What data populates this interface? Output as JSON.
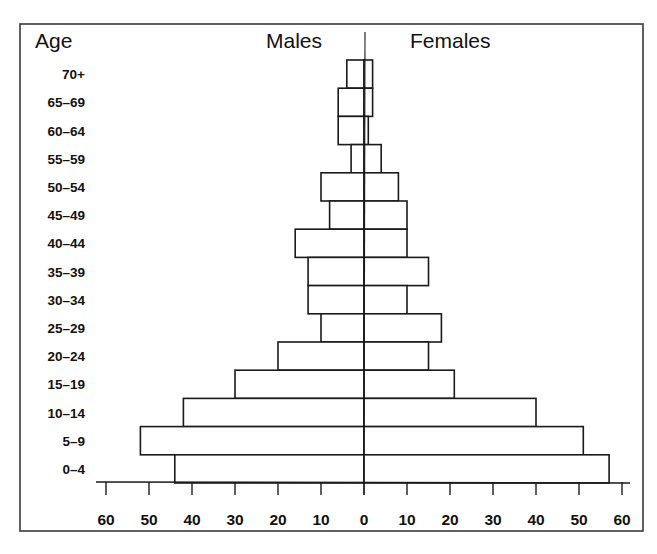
{
  "chart_data": {
    "type": "bar",
    "orientation": "horizontal",
    "subtype": "population-pyramid",
    "title": "",
    "y_header": "Age",
    "left_header": "Males",
    "right_header": "Females",
    "categories": [
      "70+",
      "65–69",
      "60–64",
      "55–59",
      "50–54",
      "45–49",
      "40–44",
      "35–39",
      "30–34",
      "25–29",
      "20–24",
      "15–19",
      "10–14",
      "5–9",
      "0–4"
    ],
    "series": [
      {
        "name": "Males",
        "side": "left",
        "values": [
          4,
          6,
          6,
          3,
          10,
          8,
          16,
          13,
          13,
          10,
          20,
          30,
          42,
          52,
          44
        ]
      },
      {
        "name": "Females",
        "side": "right",
        "values": [
          2,
          2,
          1,
          4,
          8,
          10,
          10,
          15,
          10,
          18,
          15,
          21,
          40,
          51,
          57
        ]
      }
    ],
    "x_ticks": [
      60,
      50,
      40,
      30,
      20,
      10,
      0,
      10,
      20,
      30,
      40,
      50,
      60
    ],
    "xlim": [
      -60,
      60
    ],
    "xlabel": "",
    "grid": false,
    "legend": "none",
    "colors": {
      "bar_fill": "#ffffff",
      "bar_stroke": "#1a1a1a",
      "frame": "#3a3a3a"
    }
  }
}
